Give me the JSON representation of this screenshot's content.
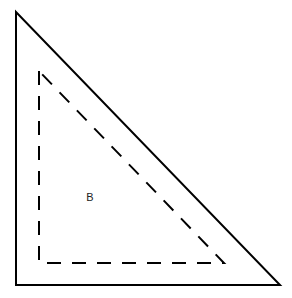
{
  "diagram": {
    "outer_triangle": {
      "points": "16,12 16,285 280,285",
      "stroke": "#000000",
      "style": "solid"
    },
    "inner_triangle": {
      "points": "39,71 39,263 224,263",
      "stroke": "#000000",
      "style": "dashed"
    },
    "label": {
      "text": "B",
      "x": 90,
      "y": 201
    }
  }
}
